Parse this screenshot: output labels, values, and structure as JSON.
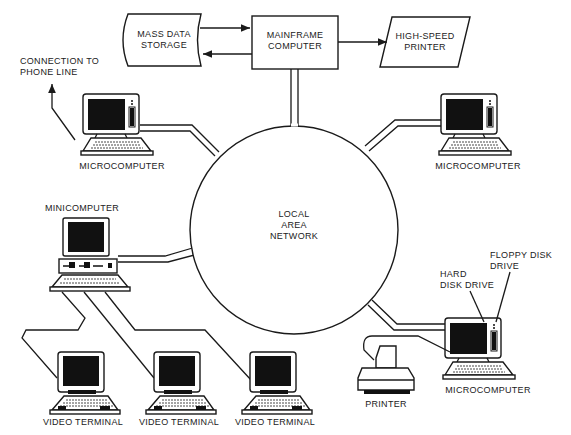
{
  "diagram": {
    "nodes": {
      "mass_storage": {
        "label_line1": "MASS DATA",
        "label_line2": "STORAGE"
      },
      "mainframe": {
        "label_line1": "MAINFRAME",
        "label_line2": "COMPUTER"
      },
      "printer_hs": {
        "label_line1": "HIGH-SPEED",
        "label_line2": "PRINTER"
      },
      "lan": {
        "label_line1": "LOCAL",
        "label_line2": "AREA",
        "label_line3": "NETWORK"
      },
      "phone": {
        "label_line1": "CONNECTION TO",
        "label_line2": "PHONE LINE"
      },
      "micro_left": {
        "label": "MICROCOMPUTER"
      },
      "micro_right": {
        "label": "MICROCOMPUTER"
      },
      "micro_bottom": {
        "label": "MICROCOMPUTER"
      },
      "minicomputer": {
        "label": "MINICOMPUTER"
      },
      "terminal_1": {
        "label": "VIDEO TERMINAL"
      },
      "terminal_2": {
        "label": "VIDEO TERMINAL"
      },
      "terminal_3": {
        "label": "VIDEO TERMINAL"
      },
      "printer": {
        "label": "PRINTER"
      },
      "hard_disk": {
        "label_line1": "HARD",
        "label_line2": "DISK DRIVE"
      },
      "floppy": {
        "label_line1": "FLOPPY DISK",
        "label_line2": "DRIVE"
      }
    },
    "edges": [
      {
        "from": "mass_storage",
        "to": "mainframe",
        "type": "arrow"
      },
      {
        "from": "mainframe",
        "to": "mass_storage",
        "type": "arrow"
      },
      {
        "from": "mainframe",
        "to": "printer_hs",
        "type": "arrow"
      },
      {
        "from": "mainframe",
        "to": "lan",
        "type": "pipe"
      },
      {
        "from": "micro_left",
        "to": "lan",
        "type": "pipe"
      },
      {
        "from": "micro_right",
        "to": "lan",
        "type": "pipe"
      },
      {
        "from": "minicomputer",
        "to": "lan",
        "type": "pipe"
      },
      {
        "from": "micro_bottom",
        "to": "lan",
        "type": "pipe"
      },
      {
        "from": "micro_left",
        "to": "phone",
        "type": "arrow"
      },
      {
        "from": "minicomputer",
        "to": "terminal_1",
        "type": "cable"
      },
      {
        "from": "minicomputer",
        "to": "terminal_2",
        "type": "cable"
      },
      {
        "from": "minicomputer",
        "to": "terminal_3",
        "type": "cable"
      },
      {
        "from": "micro_bottom",
        "to": "printer",
        "type": "cable"
      }
    ]
  }
}
